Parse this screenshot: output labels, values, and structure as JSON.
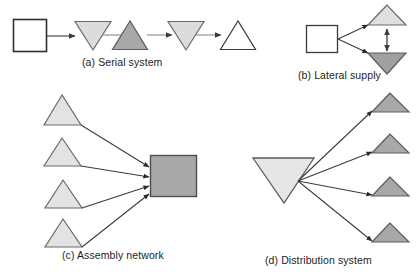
{
  "figure": {
    "type": "supply-chain-network-topology-diagram",
    "background_color": "#ffffff",
    "line_color": "#3b3b3b",
    "panels": [
      {
        "id": "a",
        "caption": "(a) Serial system",
        "description": "Single linear chain of nodes connected by arrows left to right",
        "nodes": [
          {
            "name": "node-a1",
            "shape": "square",
            "fill": "#ffffff"
          },
          {
            "name": "node-a2",
            "shape": "triangle-down",
            "fill": "#dcdcdc"
          },
          {
            "name": "node-a3",
            "shape": "triangle-up",
            "fill": "#a8a8a8"
          },
          {
            "name": "node-a4",
            "shape": "triangle-down",
            "fill": "#dcdcdc"
          },
          {
            "name": "node-a5",
            "shape": "triangle-up",
            "fill": "#ffffff"
          }
        ],
        "arrows": 4,
        "arrow_style": "single-headed"
      },
      {
        "id": "b",
        "caption": "(b) Lateral supply",
        "description": "One square feeding two stockpoints that exchange laterally via a double-headed arrow",
        "nodes": [
          {
            "name": "node-b1",
            "shape": "square",
            "fill": "#ffffff"
          },
          {
            "name": "node-b2",
            "shape": "triangle-up",
            "fill": "#e0e0e0"
          },
          {
            "name": "node-b3",
            "shape": "triangle-down",
            "fill": "#a0a0a0"
          }
        ],
        "arrows": 3,
        "arrow_style": "two-single-headed-plus-one-double-headed"
      },
      {
        "id": "c",
        "caption": "(c) Assembly network",
        "description": "Four component stockpoints converging into one assembly facility",
        "nodes": [
          {
            "name": "node-c1",
            "shape": "triangle-up",
            "fill": "#e3e3e3"
          },
          {
            "name": "node-c2",
            "shape": "triangle-up",
            "fill": "#e3e3e3"
          },
          {
            "name": "node-c3",
            "shape": "triangle-up",
            "fill": "#e3e3e3"
          },
          {
            "name": "node-c4",
            "shape": "triangle-up",
            "fill": "#e3e3e3"
          },
          {
            "name": "node-c5",
            "shape": "square",
            "fill": "#a8a8a8"
          }
        ],
        "arrows": 4,
        "arrow_style": "single-headed"
      },
      {
        "id": "d",
        "caption": "(d) Distribution system",
        "description": "One large central stockpoint distributing to four downstream stockpoints",
        "nodes": [
          {
            "name": "node-d1",
            "shape": "triangle-down",
            "fill": "#e6e6e6"
          },
          {
            "name": "node-d2",
            "shape": "triangle-up",
            "fill": "#a8a8a8"
          },
          {
            "name": "node-d3",
            "shape": "triangle-up",
            "fill": "#a8a8a8"
          },
          {
            "name": "node-d4",
            "shape": "triangle-up",
            "fill": "#a8a8a8"
          },
          {
            "name": "node-d5",
            "shape": "triangle-up",
            "fill": "#a8a8a8"
          }
        ],
        "arrows": 4,
        "arrow_style": "single-headed"
      }
    ]
  }
}
